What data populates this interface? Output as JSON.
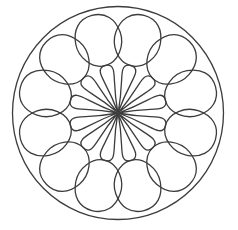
{
  "figure": {
    "background": "#ffffff",
    "stroke_color": "#3c3c3c",
    "stroke_width": 1.3,
    "center": [
      118,
      113
    ],
    "outer_circle": {
      "rx": 105.5,
      "ry": 106.5
    },
    "outer_lobes": {
      "count": 12,
      "start_angle_deg": 15,
      "inner_radius": 49,
      "outer_radius": 101,
      "inner_half_width": 9,
      "outer_half_width": 23
    },
    "inner_petals": {
      "count": 12,
      "start_angle_deg": 15,
      "tip_radius": 1,
      "end_radius": 50,
      "half_width": 6.5
    }
  }
}
